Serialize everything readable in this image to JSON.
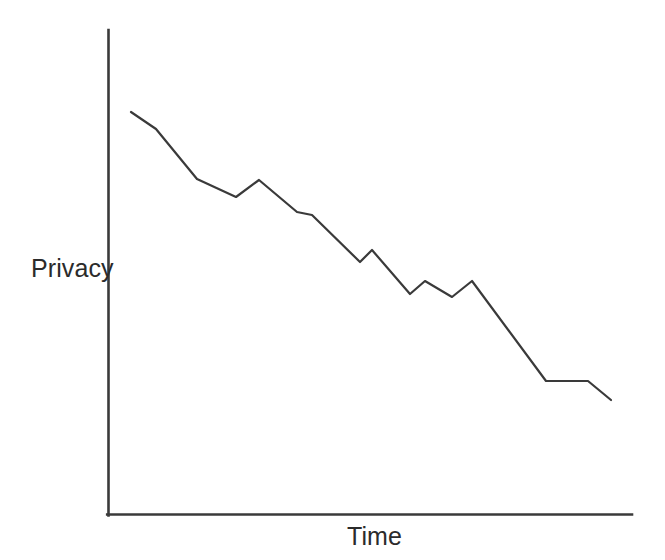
{
  "chart_data": {
    "type": "line",
    "title": "",
    "subtitle": "",
    "xlabel": "Time",
    "ylabel": "Privacy",
    "grid": false,
    "legend": null,
    "legend_position": "none",
    "annotations": [],
    "xtick_labels": [],
    "ytick_labels": [],
    "xlim": [
      0,
      100
    ],
    "ylim": [
      0,
      100
    ],
    "axis_color": "#3a3a3a",
    "line_color": "#3a3a3a",
    "background_color": "#ffffff",
    "series": [
      {
        "name": "Privacy over time",
        "x": [
          4.8,
          9.5,
          17.0,
          24.4,
          28.8,
          36.1,
          39.0,
          47.9,
          51.4,
          55.0,
          57.9,
          62.1,
          65.2,
          69.3,
          74.0,
          83.5,
          91.3,
          95.9
        ],
        "values": [
          83.2,
          79.5,
          69.4,
          65.9,
          69.2,
          62.3,
          61.7,
          52.0,
          54.4,
          45.8,
          48.5,
          45.5,
          48.8,
          28.6,
          28.6,
          28.6,
          28.6,
          24.7
        ],
        "points_px": [
          [
            131,
            112
          ],
          [
            156,
            129
          ],
          [
            197,
            179
          ],
          [
            236,
            197
          ],
          [
            259,
            180
          ],
          [
            297,
            212
          ],
          [
            312,
            215
          ],
          [
            360,
            262
          ],
          [
            372,
            250
          ],
          [
            410,
            294
          ],
          [
            425,
            281
          ],
          [
            452,
            297
          ],
          [
            472,
            281
          ],
          [
            546,
            381
          ],
          [
            588,
            381
          ],
          [
            611,
            400
          ]
        ]
      }
    ]
  },
  "figure": {
    "width": 665,
    "height": 560,
    "axes": {
      "y_axis_name": "vertical-axis",
      "x_axis_name": "horizontal-axis",
      "origin_px": [
        108,
        515
      ],
      "y_top_px": 30,
      "x_right_px": 632
    }
  }
}
